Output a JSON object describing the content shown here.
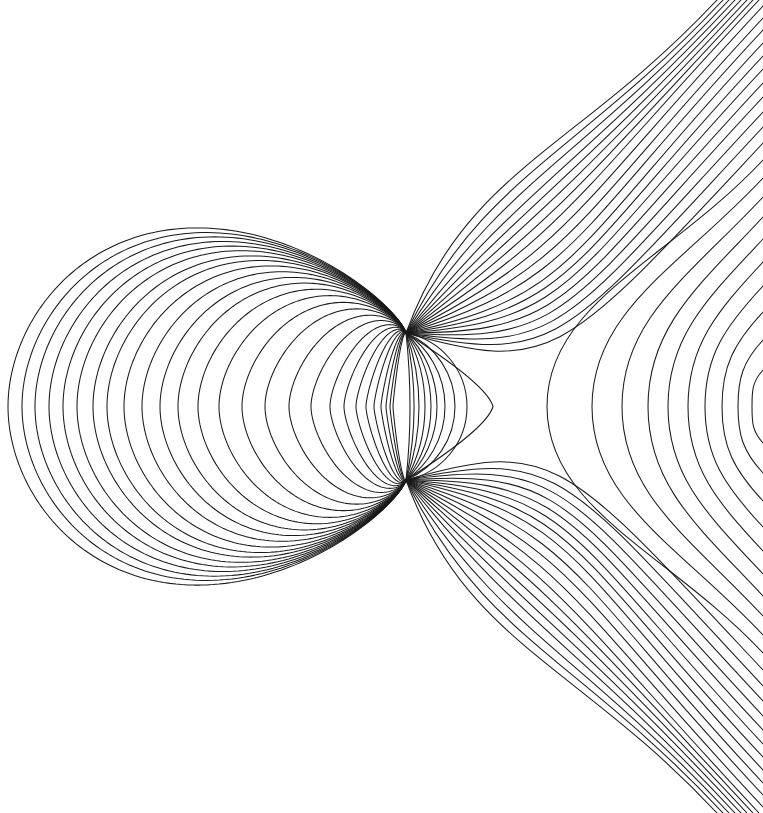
{
  "figure": {
    "type": "field-line diagram",
    "width": 763,
    "height": 813,
    "background": "#ffffff",
    "line_color": "#1a1a1a",
    "foci": {
      "upper": [
        406,
        333
      ],
      "lower": [
        406,
        480
      ]
    },
    "mirror_y": 406.5
  },
  "families": {
    "left_loops": {
      "description": "closed curves through both foci bulging left",
      "apex_x": [
        8,
        22,
        35,
        49,
        63,
        77,
        93,
        107,
        124,
        142,
        160,
        178,
        198,
        219,
        242,
        265,
        289,
        311,
        330,
        344,
        356,
        366,
        374,
        381,
        386,
        390,
        393
      ],
      "outer_height_half": 229,
      "skew_power": 0.65
    },
    "lens_right_arcs": {
      "description": "arcs through both foci bulging right",
      "apex_x": [
        410,
        414,
        419,
        425,
        431,
        437,
        445,
        455,
        467
      ]
    },
    "lens_tip": {
      "apex_x": 493
    },
    "fan": {
      "description": "curves leaving each focus toward top/bottom-right, mirrored",
      "initial_angles_deg": [
        -70,
        -64,
        -58,
        -52,
        -47,
        -42,
        -37,
        -32,
        -27,
        -22,
        -17,
        -12,
        -8,
        -4,
        0,
        4,
        8,
        12,
        16
      ],
      "top_edge_exit_x": [
        717,
        723,
        729,
        735,
        741,
        747,
        753,
        759
      ],
      "right_edge_exit_y": [
        6,
        18,
        30,
        43,
        56,
        69,
        83,
        97,
        112,
        127,
        143
      ]
    },
    "c_curves": {
      "description": "C-shaped curves opening right, vertex on symmetry axis",
      "vertex_x": [
        547,
        592,
        622,
        648,
        668,
        688,
        705,
        722,
        738,
        752
      ],
      "right_edge_exit_y": [
        160,
        178,
        197,
        217,
        239,
        262,
        286,
        312,
        340,
        370
      ]
    },
    "asymptote_slope": 1.07
  }
}
